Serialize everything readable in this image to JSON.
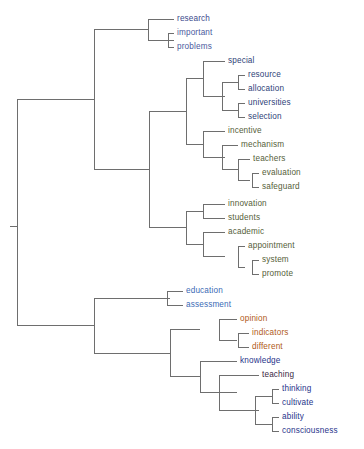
{
  "figure": {
    "type": "dendrogram",
    "orientation": "horizontal-left-root",
    "background_color": "#ffffff",
    "link_color": "#6e6e6e",
    "link_width": 1
  },
  "chart_data": {
    "type": "dendrogram",
    "title": "",
    "xlabel": "",
    "ylabel": "",
    "grid": false,
    "legend": "none",
    "orientation": "horizontal",
    "leaf_count": 26,
    "leaves": [
      {
        "label": "research",
        "color": "#3b4a8c",
        "x": 177,
        "y": 19
      },
      {
        "label": "important",
        "color": "#4a5a9e",
        "x": 177,
        "y": 33
      },
      {
        "label": "problems",
        "color": "#4a5a9e",
        "x": 177,
        "y": 47
      },
      {
        "label": "special",
        "color": "#2f3f78",
        "x": 228,
        "y": 61
      },
      {
        "label": "resource",
        "color": "#2f3f78",
        "x": 248,
        "y": 75
      },
      {
        "label": "allocation",
        "color": "#2f3f78",
        "x": 248,
        "y": 89
      },
      {
        "label": "universities",
        "color": "#2f3f78",
        "x": 248,
        "y": 103
      },
      {
        "label": "selection",
        "color": "#2f3f78",
        "x": 248,
        "y": 117
      },
      {
        "label": "incentive",
        "color": "#55603a",
        "x": 228,
        "y": 131
      },
      {
        "label": "mechanism",
        "color": "#55603a",
        "x": 241,
        "y": 145
      },
      {
        "label": "teachers",
        "color": "#55603a",
        "x": 253,
        "y": 159
      },
      {
        "label": "evaluation",
        "color": "#55603a",
        "x": 262,
        "y": 173
      },
      {
        "label": "safeguard",
        "color": "#55603a",
        "x": 262,
        "y": 187
      },
      {
        "label": "innovation",
        "color": "#55603a",
        "x": 228,
        "y": 204
      },
      {
        "label": "students",
        "color": "#55603a",
        "x": 228,
        "y": 218
      },
      {
        "label": "academic",
        "color": "#55603a",
        "x": 228,
        "y": 232
      },
      {
        "label": "appointment",
        "color": "#55603a",
        "x": 248,
        "y": 246
      },
      {
        "label": "system",
        "color": "#55603a",
        "x": 262,
        "y": 260
      },
      {
        "label": "promote",
        "color": "#55603a",
        "x": 262,
        "y": 274
      },
      {
        "label": "education",
        "color": "#3b6ab5",
        "x": 186,
        "y": 291
      },
      {
        "label": "assessment",
        "color": "#3b6ab5",
        "x": 186,
        "y": 305
      },
      {
        "label": "opinion",
        "color": "#b05a20",
        "x": 240,
        "y": 319
      },
      {
        "label": "indicators",
        "color": "#b05a20",
        "x": 252,
        "y": 333
      },
      {
        "label": "different",
        "color": "#b05a20",
        "x": 252,
        "y": 347
      },
      {
        "label": "knowledge",
        "color": "#27348a",
        "x": 240,
        "y": 361
      },
      {
        "label": "teaching",
        "color": "#3a1f42",
        "x": 262,
        "y": 375
      },
      {
        "label": "thinking",
        "color": "#27348a",
        "x": 282,
        "y": 389
      },
      {
        "label": "cultivate",
        "color": "#27348a",
        "x": 282,
        "y": 403
      },
      {
        "label": "ability",
        "color": "#27348a",
        "x": 282,
        "y": 417
      },
      {
        "label": "consciousness",
        "color": "#27348a",
        "x": 282,
        "y": 431
      }
    ],
    "links": [
      {
        "name": "important-problems",
        "x": 168,
        "y1": 33,
        "y2": 47,
        "leaf_x": 174
      },
      {
        "name": "research-cluster",
        "x": 148,
        "y1": 19,
        "y2": 40,
        "leaf_x": 174
      },
      {
        "name": "resource-allocation",
        "x": 238,
        "y1": 75,
        "y2": 89,
        "leaf_x": 245
      },
      {
        "name": "universities-selection",
        "x": 238,
        "y1": 103,
        "y2": 117,
        "leaf_x": 245
      },
      {
        "name": "resource-group",
        "x": 222,
        "y1": 82,
        "y2": 110,
        "leaf_x": 238
      },
      {
        "name": "special-group",
        "x": 203,
        "y1": 61,
        "y2": 96,
        "leaf_x": 225
      },
      {
        "name": "evaluation-safeguard",
        "x": 252,
        "y1": 173,
        "y2": 187,
        "leaf_x": 259
      },
      {
        "name": "teachers-group",
        "x": 238,
        "y1": 159,
        "y2": 180,
        "leaf_x": 250
      },
      {
        "name": "mechanism-group",
        "x": 222,
        "y1": 145,
        "y2": 169.5,
        "leaf_x": 238
      },
      {
        "name": "incentive-group",
        "x": 203,
        "y1": 131,
        "y2": 157,
        "leaf_x": 225
      },
      {
        "name": "special-incentive",
        "x": 186,
        "y1": 78.5,
        "y2": 144,
        "leaf_x": 203
      },
      {
        "name": "innovation-students",
        "x": 203,
        "y1": 204,
        "y2": 218,
        "leaf_x": 225
      },
      {
        "name": "system-promote",
        "x": 252,
        "y1": 260,
        "y2": 274,
        "leaf_x": 259
      },
      {
        "name": "appointment-group",
        "x": 238,
        "y1": 246,
        "y2": 267,
        "leaf_x": 245
      },
      {
        "name": "academic-group",
        "x": 203,
        "y1": 232,
        "y2": 256.5,
        "leaf_x": 225
      },
      {
        "name": "innovation-academic",
        "x": 186,
        "y1": 211,
        "y2": 244,
        "leaf_x": 203
      },
      {
        "name": "upper-mid-cluster",
        "x": 149,
        "y1": 111,
        "y2": 227.5,
        "leaf_x": 186
      },
      {
        "name": "upper-root",
        "x": 94,
        "y1": 29.5,
        "y2": 169,
        "leaf_x": 149
      },
      {
        "name": "education-assessment",
        "x": 167,
        "y1": 291,
        "y2": 305,
        "leaf_x": 183
      },
      {
        "name": "indicators-different",
        "x": 238,
        "y1": 333,
        "y2": 347,
        "leaf_x": 249
      },
      {
        "name": "opinion-group",
        "x": 219,
        "y1": 319,
        "y2": 340,
        "leaf_x": 237
      },
      {
        "name": "thinking-cultivate",
        "x": 272,
        "y1": 389,
        "y2": 403,
        "leaf_x": 279
      },
      {
        "name": "ability-consciousness",
        "x": 272,
        "y1": 417,
        "y2": 431,
        "leaf_x": 279
      },
      {
        "name": "thinking-group",
        "x": 255,
        "y1": 396,
        "y2": 424,
        "leaf_x": 272
      },
      {
        "name": "teaching-group",
        "x": 219,
        "y1": 375,
        "y2": 410,
        "leaf_x": 259
      },
      {
        "name": "knowledge-group",
        "x": 200,
        "y1": 361,
        "y2": 392.5,
        "leaf_x": 237
      },
      {
        "name": "opinion-knowledge",
        "x": 170,
        "y1": 329.5,
        "y2": 376.8,
        "leaf_x": 200
      },
      {
        "name": "lower-root",
        "x": 94,
        "y1": 298,
        "y2": 353.1,
        "leaf_x": 170
      },
      {
        "name": "root",
        "x": 17,
        "y1": 99.2,
        "y2": 325.6,
        "leaf_x": 94
      },
      {
        "name": "root-stub",
        "x": 10,
        "y1": 226,
        "y2": 226,
        "leaf_x": 17
      }
    ]
  }
}
